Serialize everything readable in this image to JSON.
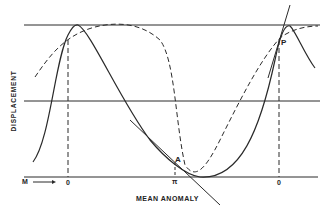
{
  "figure": {
    "type": "diagram",
    "y_axis_label": "DISPLACEMENT",
    "x_axis_label": "MEAN ANOMALY",
    "m_label": "M",
    "tick_labels": [
      "0",
      "π",
      "0"
    ],
    "points": [
      {
        "label": "A"
      },
      {
        "label": "P"
      }
    ],
    "line_color": "#222222",
    "background": "#ffffff"
  }
}
